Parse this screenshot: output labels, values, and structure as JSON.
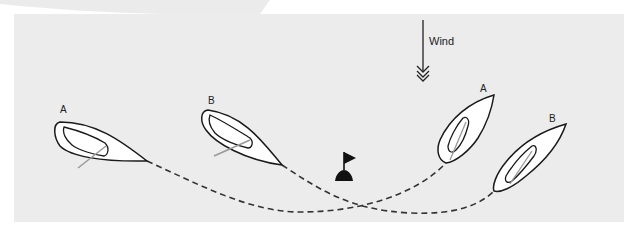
{
  "diagram": {
    "wind": {
      "label": "Wind",
      "direction": "down-arrow"
    },
    "boats": [
      {
        "id": "A",
        "label": "A",
        "position": "start"
      },
      {
        "id": "B",
        "label": "B",
        "position": "start"
      },
      {
        "id": "A",
        "label": "A",
        "position": "after-mark"
      },
      {
        "id": "B",
        "label": "B",
        "position": "after-mark"
      }
    ],
    "mark": {
      "icon": "flag-buoy-icon"
    },
    "paths": [
      {
        "boat": "A",
        "style": "dashed"
      },
      {
        "boat": "B",
        "style": "dashed"
      }
    ],
    "colors": {
      "panel_background": "#ececec",
      "hull_fill": "#ffffff",
      "outline": "#1a1a1a",
      "boom": "#999999",
      "path": "#333333"
    }
  }
}
